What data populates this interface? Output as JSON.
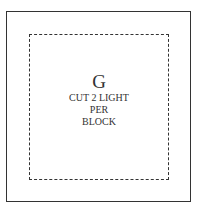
{
  "pattern": {
    "piece_letter": "G",
    "instructions": [
      "CUT 2 LIGHT",
      "PER",
      "BLOCK"
    ],
    "line_color": "#333333"
  }
}
